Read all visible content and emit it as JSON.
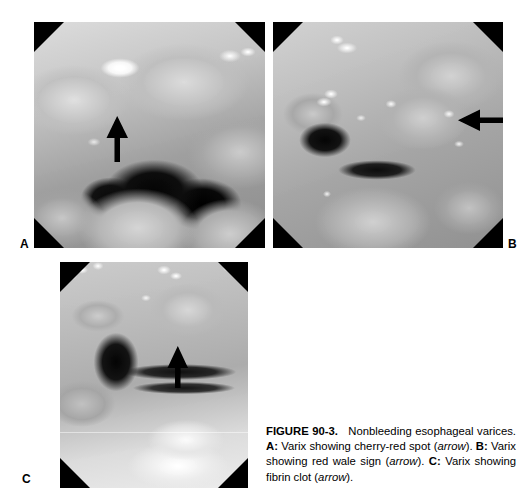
{
  "figure": {
    "label": "FIGURE 90-3.",
    "title": "Nonbleeding esophageal varices.",
    "descriptions": [
      {
        "panel": "A:",
        "text_before": " Varix showing cherry-red spot (",
        "italic": "arrow",
        "text_after": ")."
      },
      {
        "panel": "B:",
        "text_before": " Varix showing red wale sign (",
        "italic": "arrow",
        "text_after": ")."
      },
      {
        "panel": "C:",
        "text_before": " Varix showing fibrin clot (",
        "italic": "arrow",
        "text_after": ")."
      }
    ],
    "caption_full": "FIGURE 90-3. Nonbleeding esophageal varices. A: Varix showing cherry-red spot (arrow). B: Varix showing red wale sign (arrow). C: Varix showing fibrin clot (arrow)."
  },
  "panels": [
    {
      "id": "a",
      "letter": "A",
      "caption_text": "Varix showing cherry-red spot",
      "arrow_direction": "up",
      "annotation": "cherry-red spot"
    },
    {
      "id": "b",
      "letter": "B",
      "caption_text": "Varix showing red wale sign",
      "arrow_direction": "left",
      "annotation": "red wale sign"
    },
    {
      "id": "c",
      "letter": "C",
      "caption_text": "Varix showing fibrin clot",
      "arrow_direction": "up",
      "annotation": "fibrin clot"
    }
  ],
  "colors": {
    "page_background": "#ffffff",
    "text": "#000000",
    "arrow": "#000000",
    "vignette_corner": "#000000"
  }
}
